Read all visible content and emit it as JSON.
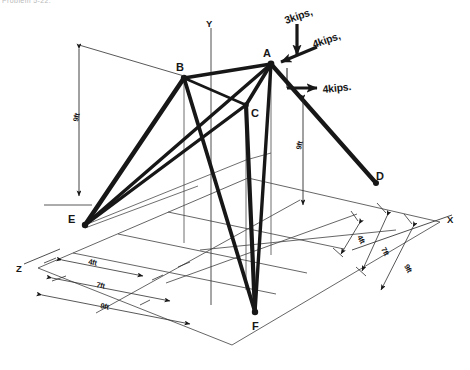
{
  "figure": {
    "title_fragment": "Problem 5-22.",
    "ink_color": "#171717",
    "grid_color": "#4a4a4a",
    "background": "#ffffff"
  },
  "axes": [
    {
      "name": "y-axis",
      "label": "Y"
    },
    {
      "name": "x-axis",
      "label": "X"
    },
    {
      "name": "z-axis",
      "label": "Z"
    }
  ],
  "nodes": [
    {
      "id": "A",
      "label": "A",
      "x": 271,
      "y": 64,
      "role": "loaded-apex"
    },
    {
      "id": "B",
      "label": "B",
      "x": 184,
      "y": 78,
      "role": "upper-joint"
    },
    {
      "id": "C",
      "label": "C",
      "x": 246,
      "y": 105,
      "role": "mid-joint"
    },
    {
      "id": "D",
      "label": "D",
      "x": 376,
      "y": 183,
      "role": "support"
    },
    {
      "id": "E",
      "label": "E",
      "x": 85,
      "y": 225,
      "role": "support"
    },
    {
      "id": "F",
      "label": "F",
      "x": 255,
      "y": 312,
      "role": "support"
    }
  ],
  "members": [
    {
      "from": "A",
      "to": "B"
    },
    {
      "from": "A",
      "to": "C"
    },
    {
      "from": "A",
      "to": "D"
    },
    {
      "from": "A",
      "to": "E"
    },
    {
      "from": "A",
      "to": "F"
    },
    {
      "from": "B",
      "to": "C"
    },
    {
      "from": "B",
      "to": "E"
    },
    {
      "from": "B",
      "to": "F"
    },
    {
      "from": "C",
      "to": "E"
    },
    {
      "from": "C",
      "to": "F"
    }
  ],
  "loads": [
    {
      "id": "load-1",
      "label": "3kips,",
      "magnitude": 3,
      "unit": "kips",
      "direction": "vertical-down"
    },
    {
      "id": "load-2",
      "label": "4kips,",
      "magnitude": 4,
      "unit": "kips",
      "direction": "diagonal-down-left"
    },
    {
      "id": "load-3",
      "label": "4kips.",
      "magnitude": 4,
      "unit": "kips",
      "direction": "horizontal-right"
    }
  ],
  "dimensions": {
    "vertical": [
      {
        "id": "height-left",
        "label": "9ft",
        "value": 9,
        "unit": "ft"
      },
      {
        "id": "height-middle",
        "label": "9ft",
        "value": 9,
        "unit": "ft"
      }
    ],
    "z_chain": [
      {
        "id": "z-4ft",
        "label": "4ft",
        "value": 4,
        "unit": "ft"
      },
      {
        "id": "z-7ft",
        "label": "7ft",
        "value": 7,
        "unit": "ft"
      },
      {
        "id": "z-9ft",
        "label": "9ft",
        "value": 9,
        "unit": "ft"
      }
    ],
    "x_chain": [
      {
        "id": "x-4ft",
        "label": "4ft",
        "value": 4,
        "unit": "ft"
      },
      {
        "id": "x-7ft",
        "label": "7ft",
        "value": 7,
        "unit": "ft"
      },
      {
        "id": "x-9ft",
        "label": "9ft",
        "value": 9,
        "unit": "ft"
      }
    ]
  }
}
